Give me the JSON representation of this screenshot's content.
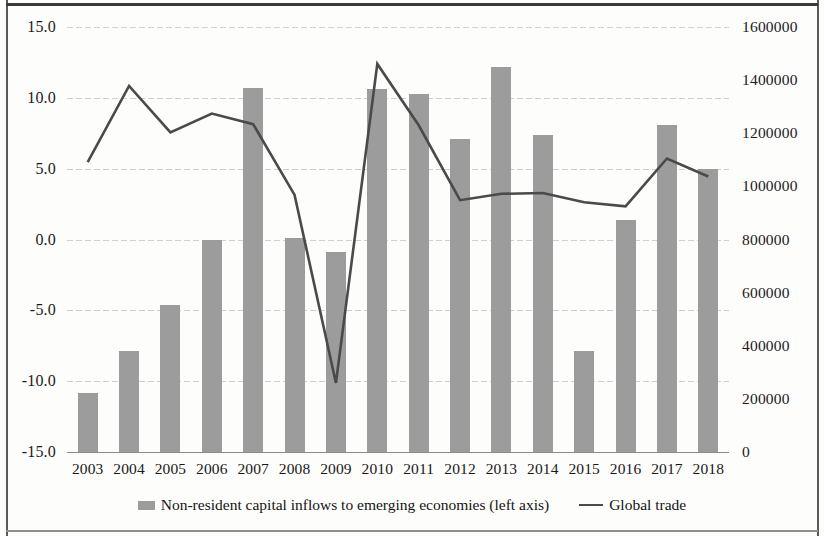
{
  "chart_data": {
    "type": "bar",
    "title": "",
    "xlabel": "",
    "categories": [
      "2003",
      "2004",
      "2005",
      "2006",
      "2007",
      "2008",
      "2009",
      "2010",
      "2011",
      "2012",
      "2013",
      "2014",
      "2015",
      "2016",
      "2017",
      "2018"
    ],
    "grid": true,
    "legend_position": "bottom",
    "axes": {
      "left": {
        "label": "Non-resident capital inflows to emerging economies (left axis)",
        "ylim": [
          -15.0,
          15.0
        ],
        "ticks": [
          15.0,
          10.0,
          5.0,
          0.0,
          -5.0,
          -10.0,
          -15.0
        ],
        "tick_labels": [
          "15.0",
          "10.0",
          "5.0",
          "0.0",
          "-5.0",
          "-10.0",
          "-15.0"
        ]
      },
      "right": {
        "label": "Global trade",
        "ylim": [
          0,
          1600000
        ],
        "ticks": [
          1600000,
          1400000,
          1200000,
          1000000,
          800000,
          600000,
          400000,
          200000,
          0
        ],
        "tick_labels": [
          "1600000",
          "1400000",
          "1200000",
          "1000000",
          "800000",
          "600000",
          "400000",
          "200000",
          "0"
        ]
      }
    },
    "series": [
      {
        "name": "Non-resident capital inflows to emerging economies (left axis)",
        "type": "bar",
        "axis": "left",
        "color": "#9c9c9c",
        "values": [
          -10.8,
          -7.9,
          -4.6,
          0.0,
          10.7,
          0.1,
          -0.9,
          10.6,
          10.3,
          7.1,
          12.2,
          7.4,
          -7.9,
          1.4,
          8.1,
          5.0
        ]
      },
      {
        "name": "Global trade",
        "type": "line",
        "axis": "right",
        "color": "#4a4a4a",
        "values": [
          1091000,
          1378000,
          1203000,
          1274000,
          1234000,
          968000,
          260000,
          1461000,
          1230000,
          948000,
          972000,
          975000,
          940000,
          925000,
          1105000,
          1037000
        ]
      }
    ]
  },
  "legend": {
    "entries": [
      {
        "icon": "bar-swatch",
        "label": "Non-resident capital inflows to emerging economies (left axis)"
      },
      {
        "icon": "line-swatch",
        "label": "Global trade"
      }
    ]
  }
}
